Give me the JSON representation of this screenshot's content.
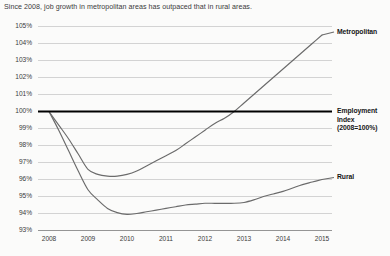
{
  "chart_data": {
    "type": "line",
    "title": "Since 2008, job growth in metropolitan areas has outpaced that in rural areas.",
    "xlabel": "",
    "ylabel": "",
    "xlim": [
      2008,
      2015
    ],
    "ylim": [
      93,
      105
    ],
    "grid": true,
    "legend_position": "right-inline",
    "y_ticks": [
      "105%",
      "104%",
      "103%",
      "102%",
      "101%",
      "100%",
      "99%",
      "98%",
      "97%",
      "96%",
      "95%",
      "94%",
      "93%"
    ],
    "y_tick_values": [
      105,
      104,
      103,
      102,
      101,
      100,
      99,
      98,
      97,
      96,
      95,
      94,
      93
    ],
    "x_ticks": [
      "2008",
      "2009",
      "2010",
      "2011",
      "2012",
      "2013",
      "2014",
      "2015"
    ],
    "x_tick_values": [
      2008,
      2009,
      2010,
      2011,
      2012,
      2013,
      2014,
      2015
    ],
    "x": [
      2008,
      2008.25,
      2008.5,
      2008.75,
      2009,
      2009.25,
      2009.5,
      2009.75,
      2010,
      2010.25,
      2010.5,
      2010.75,
      2011,
      2011.25,
      2011.5,
      2011.75,
      2012,
      2012.25,
      2012.5,
      2012.75,
      2013,
      2013.25,
      2013.5,
      2013.75,
      2014,
      2014.25,
      2014.5,
      2014.75,
      2015
    ],
    "series": [
      {
        "name": "Metropolitan",
        "color": "#6b6b6b",
        "values": [
          100.0,
          99.2,
          98.4,
          97.5,
          96.6,
          96.3,
          96.2,
          96.2,
          96.3,
          96.5,
          96.8,
          97.1,
          97.4,
          97.7,
          98.1,
          98.5,
          98.9,
          99.3,
          99.6,
          100.0,
          100.5,
          101.0,
          101.5,
          102.0,
          102.5,
          103.0,
          103.5,
          104.0,
          104.5
        ]
      },
      {
        "name": "Rural",
        "color": "#6b6b6b",
        "values": [
          100.0,
          98.9,
          97.7,
          96.5,
          95.4,
          94.8,
          94.3,
          94.05,
          93.95,
          94.0,
          94.1,
          94.2,
          94.3,
          94.4,
          94.5,
          94.55,
          94.6,
          94.6,
          94.6,
          94.6,
          94.65,
          94.8,
          95.0,
          95.15,
          95.3,
          95.5,
          95.7,
          95.85,
          96.0
        ]
      }
    ],
    "reference_line": {
      "name": "Employment Index",
      "value": 100,
      "label_line1": "Employment",
      "label_line2": "Index",
      "label_line3": "(2008=100%)",
      "color": "#000000"
    },
    "annotations": [
      {
        "text": "Metropolitan",
        "series": "Metropolitan"
      },
      {
        "text": "Rural",
        "series": "Rural"
      }
    ]
  },
  "colors": {
    "background": "#fbfbfa",
    "gridline": "#c9c9c9",
    "axis": "#8d8d8d",
    "series_line": "#6b6b6b",
    "reference_line": "#000000",
    "text": "#3a3a3a"
  }
}
